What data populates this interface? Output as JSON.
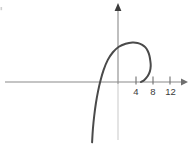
{
  "chart_data": {
    "type": "line",
    "title": "",
    "xlabel": "",
    "ylabel": "",
    "xlim": [
      -6.6,
      15.8
    ],
    "ylim": [
      -15.1,
      19.3
    ],
    "grid": false,
    "legend": null,
    "axes": {
      "x_axis_visible": true,
      "y_axis_visible": true,
      "x_axis_arrow": true,
      "y_axis_arrow": true,
      "origin_label": ""
    },
    "x_ticks": [
      {
        "value": 4,
        "label": "4"
      },
      {
        "value": 8,
        "label": "8"
      },
      {
        "value": 12,
        "label": "12"
      }
    ],
    "y_ticks": [],
    "series": [
      {
        "name": "curve",
        "color": "#4a4a4a",
        "linewidth": 2,
        "description": "open arc rising from lower-left, peaking near x = -4, then curving right and down to a cusp just right of the y-axis before returning to the x-axis",
        "points": [
          {
            "x": -6.1,
            "y": -14.2
          },
          {
            "x": -5.9,
            "y": -11.0
          },
          {
            "x": -5.6,
            "y": -8.0
          },
          {
            "x": -5.2,
            "y": -5.0
          },
          {
            "x": -4.7,
            "y": -2.2
          },
          {
            "x": -4.1,
            "y": 0.4
          },
          {
            "x": -3.4,
            "y": 2.8
          },
          {
            "x": -2.4,
            "y": 5.2
          },
          {
            "x": -1.2,
            "y": 7.0
          },
          {
            "x": 0.2,
            "y": 8.3
          },
          {
            "x": 1.8,
            "y": 9.0
          },
          {
            "x": 3.4,
            "y": 9.3
          },
          {
            "x": 4.6,
            "y": 9.2
          },
          {
            "x": 5.6,
            "y": 8.8
          },
          {
            "x": 6.4,
            "y": 8.2
          },
          {
            "x": 7.0,
            "y": 7.3
          },
          {
            "x": 7.4,
            "y": 6.2
          },
          {
            "x": 7.6,
            "y": 5.0
          },
          {
            "x": 7.7,
            "y": 3.8
          },
          {
            "x": 7.5,
            "y": 2.5
          },
          {
            "x": 7.0,
            "y": 1.4
          },
          {
            "x": 6.2,
            "y": 0.5
          },
          {
            "x": 5.4,
            "y": 0.0
          }
        ]
      }
    ],
    "colors": {
      "curve": "#4a4a4a",
      "axis": "#8a8a8a",
      "tick_text": "#3a3a3a",
      "background": "#ffffff"
    }
  }
}
